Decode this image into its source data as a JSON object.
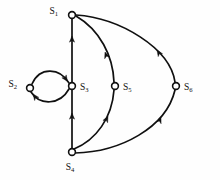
{
  "figure": {
    "type": "directed-graph",
    "background_color": "#fefefe",
    "stroke_color": "#101010"
  },
  "nodes": [
    {
      "id": "S1",
      "base": "S",
      "sub": "1",
      "x": 72,
      "y": 15,
      "r": 3.4,
      "label_x": 58,
      "label_y": 14,
      "label_anchor": "end"
    },
    {
      "id": "S2",
      "base": "S",
      "sub": "2",
      "x": 30,
      "y": 88,
      "r": 3.4,
      "label_x": 17,
      "label_y": 87,
      "label_anchor": "end"
    },
    {
      "id": "S3",
      "base": "S",
      "sub": "3",
      "x": 72,
      "y": 86,
      "r": 3.4,
      "label_x": 80,
      "label_y": 90,
      "label_anchor": "start"
    },
    {
      "id": "S5",
      "base": "S",
      "sub": "5",
      "x": 115,
      "y": 86,
      "r": 3.4,
      "label_x": 123,
      "label_y": 90,
      "label_anchor": "start"
    },
    {
      "id": "S6",
      "base": "S",
      "sub": "6",
      "x": 176,
      "y": 86,
      "r": 3.4,
      "label_x": 184,
      "label_y": 90,
      "label_anchor": "start"
    },
    {
      "id": "S4",
      "base": "S",
      "sub": "4",
      "x": 72,
      "y": 152,
      "r": 3.4,
      "label_x": 70,
      "label_y": 170,
      "label_anchor": "middle"
    }
  ],
  "edges": [
    {
      "id": "e-s3-s1",
      "from": "S3",
      "to": "S1",
      "shape": "straight",
      "path": "M 72 82 L 72 19",
      "arrow_x": 72,
      "arrow_y": 36,
      "arrow_angle": -90
    },
    {
      "id": "e-s4-s3",
      "from": "S4",
      "to": "S3",
      "shape": "straight",
      "path": "M 72 148 L 72 90",
      "arrow_x": 72,
      "arrow_y": 113,
      "arrow_angle": -90
    },
    {
      "id": "e-s2-s3",
      "from": "S2",
      "to": "S3",
      "shape": "curve-upper",
      "path": "M 32 84 C 40 66, 60 68, 69 83",
      "arrow_x": 67.5,
      "arrow_y": 81.5,
      "arrow_angle": 56
    },
    {
      "id": "e-s3-s2",
      "from": "S3",
      "to": "S2",
      "shape": "curve-lower",
      "path": "M 69 89 C 60 105, 40 106, 31 92",
      "arrow_x": 33,
      "arrow_y": 94,
      "arrow_angle": 233
    },
    {
      "id": "e-s4-s5",
      "from": "S4",
      "to": "S5",
      "shape": "curve",
      "path": "M 74 149 C 96 140, 112 118, 114 90",
      "arrow_x": 108,
      "arrow_y": 116,
      "arrow_angle": -64
    },
    {
      "id": "e-s5-s1",
      "from": "S5",
      "to": "S1",
      "shape": "curve",
      "path": "M 114 82 C 113 56, 100 30, 76 16",
      "arrow_x": 105,
      "arrow_y": 52,
      "arrow_angle": -110
    },
    {
      "id": "e-s4-s6",
      "from": "S4",
      "to": "S6",
      "shape": "curve",
      "path": "M 75 153 C 120 152, 166 128, 175 90",
      "arrow_x": 161,
      "arrow_y": 117,
      "arrow_angle": -68
    },
    {
      "id": "e-s6-s1",
      "from": "S6",
      "to": "S1",
      "shape": "curve",
      "path": "M 175 82 C 170 48, 120 18, 76 15",
      "arrow_x": 157,
      "arrow_y": 50,
      "arrow_angle": -123
    }
  ]
}
